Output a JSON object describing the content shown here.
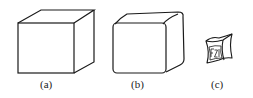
{
  "figure": {
    "panels": [
      {
        "id": "a",
        "label": "(a)",
        "description": "cube with sharp edges"
      },
      {
        "id": "b",
        "label": "(b)",
        "description": "cube with rounded edges"
      },
      {
        "id": "c",
        "label": "(c)",
        "description": "small shrunken cube with concave faces",
        "face_marking": "FZI"
      }
    ],
    "stroke_color": "#1a1a1a",
    "background": "#ffffff"
  }
}
